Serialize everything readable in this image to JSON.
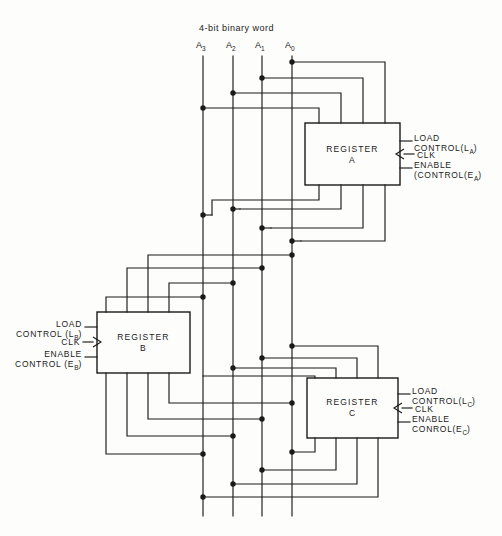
{
  "diagram": {
    "title": "4-bit binary word",
    "bus": {
      "labels": [
        "A3",
        "A2",
        "A1",
        "A0"
      ],
      "bits": [
        {
          "name": "A",
          "sub": "3"
        },
        {
          "name": "A",
          "sub": "2"
        },
        {
          "name": "A",
          "sub": "1"
        },
        {
          "name": "A",
          "sub": "0"
        }
      ],
      "x": [
        203,
        233,
        262,
        292
      ],
      "y_top": 56,
      "y_bottom": 516,
      "width": 4
    },
    "registers": [
      {
        "id": "A",
        "name_line1": "REGISTER",
        "name_line2": "A",
        "box": {
          "x": 305,
          "y": 123,
          "w": 95,
          "h": 62
        },
        "controls_side": "right",
        "controls": [
          {
            "name": "load",
            "line1": "LOAD",
            "line2": "CONTROL(L",
            "sub": "A",
            "line3": ")",
            "y": 141
          },
          {
            "name": "clk",
            "line1": "CLK",
            "y": 154,
            "clock": true
          },
          {
            "name": "enable",
            "line1": "ENABLE",
            "line2": "(CONTROL(E",
            "sub": "A",
            "line3": ")",
            "y": 168
          }
        ]
      },
      {
        "id": "B",
        "name_line1": "REGISTER",
        "name_line2": "B",
        "box": {
          "x": 97,
          "y": 312,
          "w": 93,
          "h": 61
        },
        "controls_side": "left",
        "controls": [
          {
            "name": "load",
            "line1": "LOAD",
            "line2": "CONTROL (L",
            "sub": "B",
            "line3": ")",
            "y": 327
          },
          {
            "name": "clk",
            "line1": "CLK",
            "y": 342,
            "clock": true
          },
          {
            "name": "enable",
            "line1": "ENABLE",
            "line2": "CONTROL (E",
            "sub": "B",
            "line3": ")",
            "y": 357
          }
        ]
      },
      {
        "id": "C",
        "name_line1": "REGISTER",
        "name_line2": "C",
        "box": {
          "x": 307,
          "y": 378,
          "w": 91,
          "h": 60
        },
        "controls_side": "right",
        "controls": [
          {
            "name": "load",
            "line1": "LOAD",
            "line2": "CONTROL(L",
            "sub": "C",
            "line3": ")",
            "y": 394
          },
          {
            "name": "clk",
            "line1": "CLK",
            "y": 408,
            "clock": true
          },
          {
            "name": "enable",
            "line1": "ENABLE",
            "line2": "CONROL(E",
            "sub": "C",
            "line3": ")",
            "y": 422
          }
        ]
      }
    ],
    "colors": {
      "line": "#1a1a1a",
      "background": "#fdfdfb",
      "text": "#1a1a1a"
    }
  }
}
